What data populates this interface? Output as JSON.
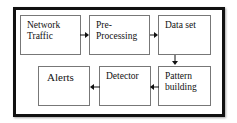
{
  "diagram": {
    "title": "",
    "nodes": [
      {
        "id": "network-traffic",
        "line1": "Network",
        "line2": "Traffic"
      },
      {
        "id": "pre-processing",
        "line1": "Pre-",
        "line2": "Processing"
      },
      {
        "id": "data-set",
        "line1": "Data set",
        "line2": ""
      },
      {
        "id": "pattern-building",
        "line1": "Pattern",
        "line2": "building"
      },
      {
        "id": "detector",
        "line1": "Detector",
        "line2": ""
      },
      {
        "id": "alerts",
        "line1": "Alerts",
        "line2": ""
      }
    ],
    "edges": [
      {
        "from": "network-traffic",
        "to": "pre-processing"
      },
      {
        "from": "pre-processing",
        "to": "data-set"
      },
      {
        "from": "data-set",
        "to": "pattern-building"
      },
      {
        "from": "pattern-building",
        "to": "detector"
      },
      {
        "from": "detector",
        "to": "alerts"
      }
    ],
    "colors": {
      "frame": "#111111",
      "node_border": "#777777",
      "arrow": "#111111",
      "text": "#111111"
    }
  }
}
